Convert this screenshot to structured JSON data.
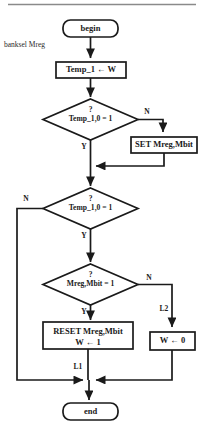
{
  "diagram": {
    "colors": {
      "stroke": "#1a1a1a",
      "background": "#ffffff",
      "rule": "#8a8a8a"
    },
    "top_rule": true,
    "nodes": {
      "begin": {
        "label": "begin",
        "type": "terminal"
      },
      "temp1_assign": {
        "label": "Temp_1 ← W",
        "type": "process"
      },
      "decision1": {
        "question": "?",
        "label": "Temp_1,0 = 1",
        "type": "decision"
      },
      "set_mreg": {
        "label": "SET Mreg,Mbit",
        "type": "process"
      },
      "decision2": {
        "question": "?",
        "label": "Temp_1,0 = 1",
        "type": "decision"
      },
      "decision3": {
        "question": "?",
        "label": "Mreg,Mbit = 1",
        "type": "decision"
      },
      "reset_mreg": {
        "line1": "RESET Mreg,Mbit",
        "line2": "W ← 1",
        "type": "process"
      },
      "w_zero": {
        "label": "W ← 0",
        "type": "process"
      },
      "end": {
        "label": "end",
        "type": "terminal"
      }
    },
    "annotations": {
      "banksel": "banksel Mreg",
      "l1": "L1",
      "l2": "L2"
    },
    "branch_labels": {
      "d1_no": "N",
      "d1_yes": "Y",
      "d2_no": "N",
      "d2_yes": "Y",
      "d3_no": "N",
      "d3_yes": "Y"
    }
  }
}
